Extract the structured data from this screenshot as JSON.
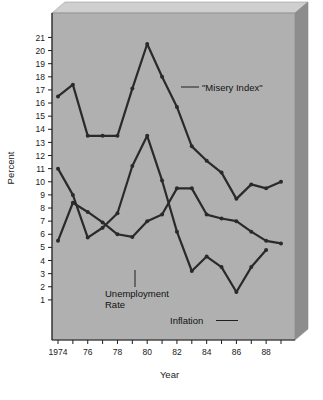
{
  "figure": {
    "panel_color": "#b0b0b0",
    "line_color": "#2a2a2a",
    "shadow_color": "#8d8d8d",
    "background": "#ffffff"
  },
  "labels": {
    "y_axis_title": "Percent",
    "x_axis_title": "Year",
    "misery": "\"Misery Index\"",
    "unemployment_line1": "Unemployment",
    "unemployment_line2": "Rate",
    "inflation": "Inflation"
  },
  "chart_data": {
    "type": "line",
    "title": "",
    "xlabel": "Year",
    "ylabel": "Percent",
    "xlim": [
      1974,
      1989
    ],
    "ylim": [
      0,
      21
    ],
    "grid": false,
    "legend": "inline-annotations",
    "x": [
      1974,
      1975,
      1976,
      1977,
      1978,
      1979,
      1980,
      1981,
      1982,
      1983,
      1984,
      1985,
      1986,
      1987,
      1988,
      1989
    ],
    "x_tick_values": [
      1974,
      1975,
      1976,
      1977,
      1978,
      1979,
      1980,
      1981,
      1982,
      1983,
      1984,
      1985,
      1986,
      1987,
      1988,
      1989
    ],
    "x_tick_labels": [
      "1974",
      "",
      "76",
      "",
      "78",
      "",
      "80",
      "",
      "82",
      "",
      "84",
      "",
      "86",
      "",
      "88",
      ""
    ],
    "y_tick_values": [
      1,
      2,
      3,
      4,
      5,
      6,
      7,
      8,
      9,
      10,
      11,
      12,
      13,
      14,
      15,
      16,
      17,
      18,
      19,
      20,
      21
    ],
    "y_tick_labels": [
      "1",
      "2",
      "3",
      "4",
      "5",
      "6",
      "7",
      "8",
      "9",
      "10",
      "11",
      "12",
      "13",
      "14",
      "15",
      "16",
      "17",
      "18",
      "19",
      "20",
      "21"
    ],
    "series": [
      {
        "name": "\"Misery Index\"",
        "values": [
          16.5,
          17.4,
          13.5,
          13.5,
          13.5,
          17.1,
          20.5,
          18.0,
          15.7,
          12.7,
          11.6,
          10.7,
          8.7,
          9.8,
          9.5,
          10.0
        ]
      },
      {
        "name": "Unemployment Rate",
        "values": [
          5.5,
          8.4,
          7.7,
          6.9,
          6.0,
          5.8,
          7.0,
          7.5,
          9.5,
          9.5,
          7.5,
          7.2,
          7.0,
          6.2,
          5.5,
          5.3
        ]
      },
      {
        "name": "Inflation",
        "values": [
          11.0,
          9.0,
          5.75,
          6.5,
          7.6,
          11.2,
          13.5,
          10.1,
          6.2,
          3.2,
          4.3,
          3.5,
          1.6,
          3.5,
          4.8,
          null
        ]
      }
    ]
  }
}
